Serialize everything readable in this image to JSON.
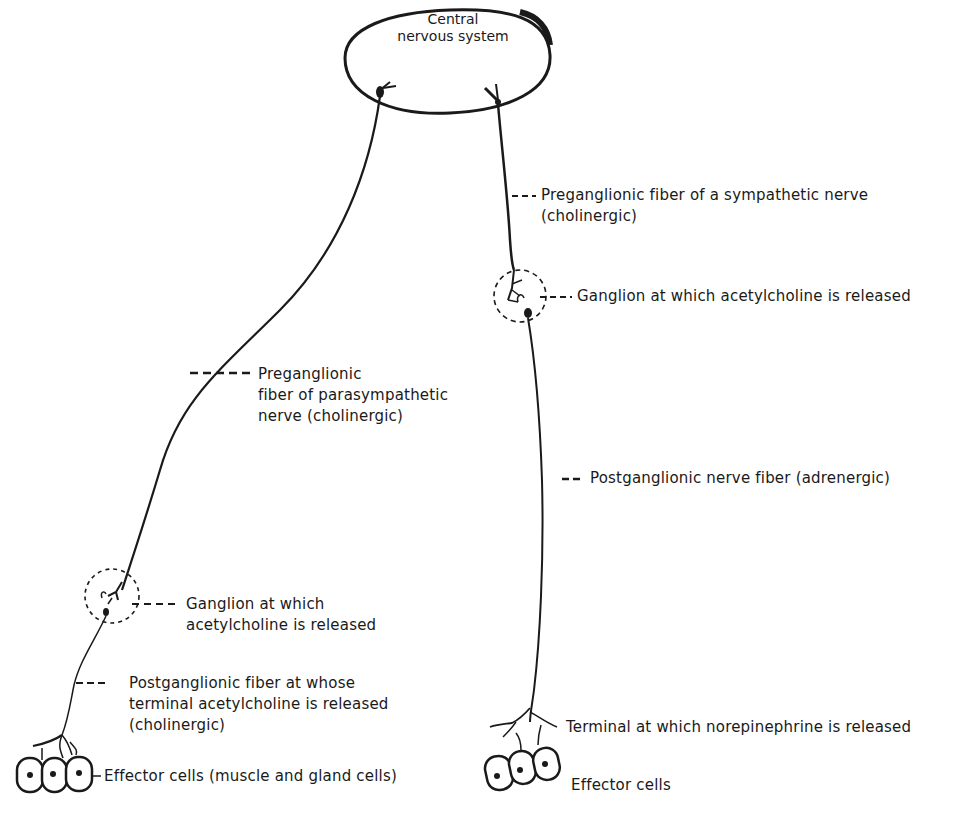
{
  "diagram": {
    "cns": {
      "line1": "Central",
      "line2": "nervous system"
    },
    "parasympathetic": {
      "preganglionic": {
        "line1": "Preganglionic",
        "line2": "fiber of parasympathetic",
        "line3": "nerve (cholinergic)"
      },
      "ganglion": {
        "line1": "Ganglion at which",
        "line2": "acetylcholine is released"
      },
      "postganglionic": {
        "line1": "Postganglionic fiber at whose",
        "line2": "terminal acetylcholine is released",
        "line3": "(cholinergic)"
      },
      "effector": "Effector cells (muscle and gland cells)"
    },
    "sympathetic": {
      "preganglionic": {
        "line1": "Preganglionic fiber of a sympathetic nerve",
        "line2": "(cholinergic)"
      },
      "ganglion": "Ganglion at which acetylcholine is released",
      "postganglionic": "Postganglionic nerve fiber (adrenergic)",
      "terminal": "Terminal at which norepinephrine is released",
      "effector": "Effector cells"
    },
    "colors": {
      "ink": "#1a1a1a",
      "background": "#ffffff"
    }
  }
}
